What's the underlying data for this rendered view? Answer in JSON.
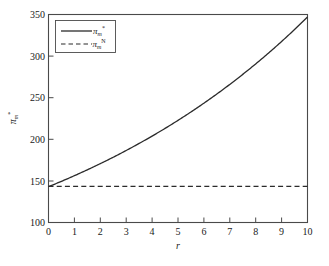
{
  "chart": {
    "xlabel": "r",
    "ylabel": "π",
    "ylabel_sub": "m",
    "ylabel_sup": "*",
    "xticks": [
      "0",
      "1",
      "2",
      "3",
      "4",
      "5",
      "6",
      "7",
      "8",
      "9",
      "10"
    ],
    "yticks": [
      "100",
      "150",
      "200",
      "250",
      "300",
      "350"
    ],
    "legend": {
      "entry1_symbol": "π",
      "entry1_sub": "m",
      "entry1_sup": "*",
      "entry1_style": "solid",
      "entry2_symbol": "π",
      "entry2_sub": "m",
      "entry2_sup": "N",
      "entry2_style": "dashed"
    }
  },
  "chart_data": {
    "type": "line",
    "title": "",
    "xlabel": "r",
    "ylabel": "π*_m",
    "xlim": [
      0,
      10
    ],
    "ylim": [
      100,
      350
    ],
    "xticks": [
      0,
      1,
      2,
      3,
      4,
      5,
      6,
      7,
      8,
      9,
      10
    ],
    "yticks": [
      100,
      150,
      200,
      250,
      300,
      350
    ],
    "grid": false,
    "legend_position": "upper-left",
    "x": [
      0,
      0.5,
      1,
      1.5,
      2,
      2.5,
      3,
      3.5,
      4,
      4.5,
      5,
      5.5,
      6,
      6.5,
      7,
      7.5,
      8,
      8.5,
      9,
      9.5,
      10
    ],
    "series": [
      {
        "name": "π*_m",
        "style": "solid",
        "color": "#2b2b2b",
        "values": [
          143,
          145,
          148,
          152,
          157,
          163,
          170,
          178,
          187,
          197,
          190,
          220,
          233,
          247,
          262,
          278,
          265,
          313,
          332,
          339,
          347
        ]
      },
      {
        "name": "πN_m",
        "style": "dashed",
        "color": "#2b2b2b",
        "values": [
          143.5,
          143.5,
          143.5,
          143.5,
          143.5,
          143.5,
          143.5,
          143.5,
          143.5,
          143.5,
          143.5,
          143.5,
          143.5,
          143.5,
          143.5,
          143.5,
          143.5,
          143.5,
          143.5,
          143.5,
          143.5
        ]
      }
    ]
  }
}
